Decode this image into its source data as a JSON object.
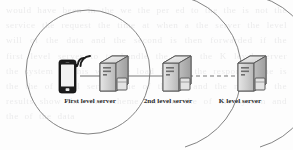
{
  "figure": {
    "background_text": "would have been in the we the per ed to the the is not the service the request the time at when a the server the level will of the data and the second is then forwarded if the first level server to to handle the user the K level server the system in this way the load is and the response time is the the of level servers the of the be and the network the results show that the scheme can the the of the system and the of the data"
  },
  "nodes": [
    {
      "id": "client",
      "icon": "smartphone-wifi-icon",
      "label": "",
      "x": 72,
      "y": 74
    },
    {
      "id": "server-1",
      "icon": "server-icon",
      "label": "First level server",
      "x": 109,
      "y": 74
    },
    {
      "id": "server-2",
      "icon": "server-icon",
      "label": "2nd level server",
      "x": 172,
      "y": 74
    },
    {
      "id": "server-k",
      "icon": "server-icon",
      "label": "K level server",
      "x": 248,
      "y": 74
    }
  ],
  "labels": {
    "first_level_server": "First level server",
    "second_level_server": "2nd level server",
    "k_level_server": "K level server"
  },
  "connections": [
    {
      "id": "client-to-server1",
      "from": "client",
      "to": "server-1",
      "style": "solid"
    },
    {
      "id": "server1-to-server2",
      "from": "server-1",
      "to": "server-2",
      "style": "solid"
    },
    {
      "id": "server2-to-serverk",
      "from": "server-2",
      "to": "server-k",
      "style": "dashed"
    }
  ],
  "boundaries": [
    {
      "id": "tier-1-circle",
      "shape": "circle",
      "cx": 88,
      "cy": 72,
      "r": 62
    },
    {
      "id": "tier-2-arc",
      "shape": "arc",
      "cx": 110,
      "cy": 72,
      "r": 78
    },
    {
      "id": "tier-k-arc",
      "shape": "arc",
      "cx": 185,
      "cy": 72,
      "r": 78
    }
  ],
  "colors": {
    "outline": "#6f6f6f",
    "connector": "#7a7a7a",
    "server_body": "#d4d4d4",
    "server_edge": "#5a5a5a",
    "phone_body": "#1c1c1c",
    "phone_screen": "#f2f2f2",
    "label_text": "#2b2b2b",
    "background": "#fdfdfd"
  }
}
